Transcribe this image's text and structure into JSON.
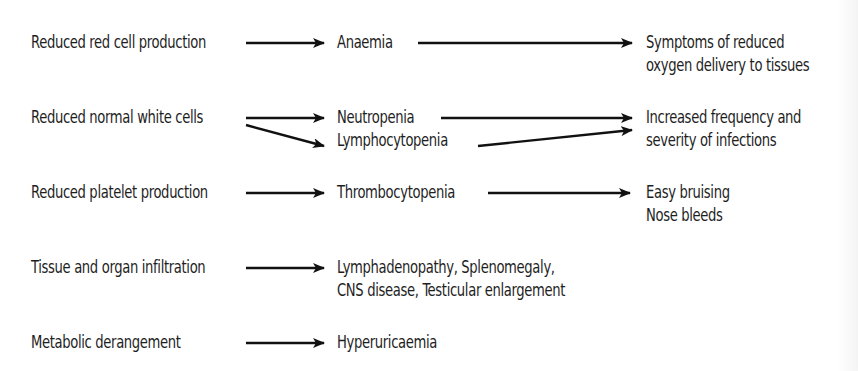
{
  "diagram": {
    "type": "flow",
    "rows": [
      {
        "cause": "Reduced red cell production",
        "effects": [
          "Anaemia"
        ],
        "consequence": [
          "Symptoms of reduced",
          "oxygen delivery to tissues"
        ]
      },
      {
        "cause": "Reduced normal white cells",
        "effects": [
          "Neutropenia",
          "Lymphocytopenia"
        ],
        "consequence": [
          "Increased frequency and",
          "severity of infections"
        ]
      },
      {
        "cause": "Reduced platelet production",
        "effects": [
          "Thrombocytopenia"
        ],
        "consequence": [
          "Easy bruising",
          "Nose bleeds"
        ]
      },
      {
        "cause": "Tissue and organ infiltration",
        "effects": [
          "Lymphadenopathy, Splenomegaly,",
          "CNS disease, Testicular enlargement"
        ],
        "consequence": []
      },
      {
        "cause": "Metabolic derangement",
        "effects": [
          "Hyperuricaemia"
        ],
        "consequence": []
      }
    ],
    "colors": {
      "text": "#1e1e1e",
      "arrow": "#111111",
      "background": "#ffffff"
    }
  }
}
